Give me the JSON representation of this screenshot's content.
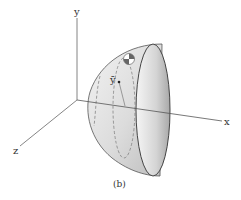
{
  "figure": {
    "caption": "(b)",
    "axes": {
      "x_label": "x",
      "y_label": "y",
      "z_label": "z"
    },
    "centroid": {
      "label": "ȳ",
      "symbol": "centroid-marker"
    },
    "solid": {
      "type": "paraboloid of revolution",
      "fill_color": "#d8d8d8",
      "rim_color": "#444444"
    },
    "line_color": "#555555"
  }
}
